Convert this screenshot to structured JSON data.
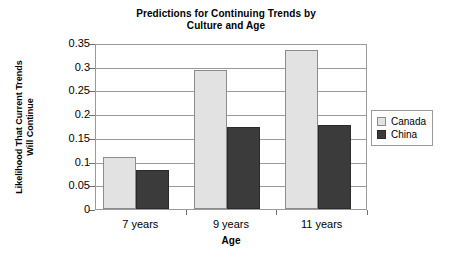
{
  "chart_data": {
    "type": "bar",
    "title": "Predictions for Continuing Trends by Culture and Age",
    "title_line1": "Predictions for Continuing Trends by",
    "title_line2": "Culture and Age",
    "xlabel": "Age",
    "ylabel": "Likelihood That Current Trends Will Continue",
    "ylabel_line1": "Likelihood That Current Trends",
    "ylabel_line2": "Will Continue",
    "categories": [
      "7 years",
      "9 years",
      "11 years"
    ],
    "series": [
      {
        "name": "Canada",
        "color": "#e2e2e2",
        "values": [
          0.11,
          0.293,
          0.335
        ]
      },
      {
        "name": "China",
        "color": "#3b3b3b",
        "values": [
          0.083,
          0.172,
          0.177
        ]
      }
    ],
    "ylim": [
      0,
      0.35
    ],
    "ytick_values": [
      0,
      0.05,
      0.1,
      0.15,
      0.2,
      0.25,
      0.3,
      0.35
    ],
    "ytick_labels": [
      "0",
      "0.05",
      "0.1",
      "0.15",
      "0.2",
      "0.25",
      "0.3",
      "0.35"
    ],
    "grid": "horizontal",
    "legend_position": "right"
  }
}
